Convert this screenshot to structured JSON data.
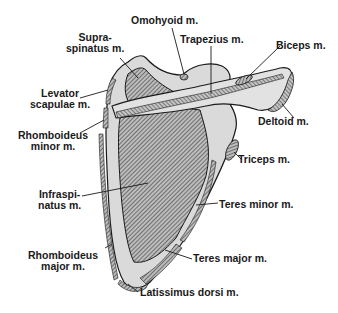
{
  "diagram": {
    "colors": {
      "bone": "#d8d8d8",
      "bone_outline": "#1a1a1a",
      "muscle_hatch": "#555555",
      "background": "#ffffff"
    },
    "labels": [
      {
        "id": "omohyoid",
        "lines": [
          "Omohyoid m."
        ]
      },
      {
        "id": "trapezius",
        "lines": [
          "Trapezius m."
        ]
      },
      {
        "id": "supraspinatus",
        "lines": [
          "Supra-",
          "spinatus m."
        ]
      },
      {
        "id": "biceps",
        "lines": [
          "Biceps m."
        ]
      },
      {
        "id": "levator-scapulae",
        "lines": [
          "Levator",
          "scapulae m."
        ]
      },
      {
        "id": "deltoid",
        "lines": [
          "Deltoid m."
        ]
      },
      {
        "id": "rhomboideus-minor",
        "lines": [
          "Rhomboideus",
          "minor m."
        ]
      },
      {
        "id": "triceps",
        "lines": [
          "Triceps m."
        ]
      },
      {
        "id": "infraspinatus",
        "lines": [
          "Infraspi-",
          "natus m."
        ]
      },
      {
        "id": "teres-minor",
        "lines": [
          "Teres minor m."
        ]
      },
      {
        "id": "rhomboideus-major",
        "lines": [
          "Rhomboideus",
          "major m."
        ]
      },
      {
        "id": "teres-major",
        "lines": [
          "Teres major m."
        ]
      },
      {
        "id": "latissimus-dorsi",
        "lines": [
          "Latissimus dorsi m."
        ]
      }
    ]
  }
}
